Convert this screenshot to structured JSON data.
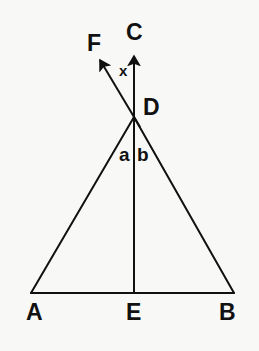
{
  "figure": {
    "kind": "geometry-diagram",
    "background_color": "#f8f8f6",
    "stroke_color": "#111111",
    "stroke_width": 2
  },
  "points": {
    "A": {
      "label": "A",
      "x": 31,
      "y": 293
    },
    "B": {
      "label": "B",
      "x": 234,
      "y": 293
    },
    "D": {
      "label": "D",
      "x": 134,
      "y": 117
    },
    "E": {
      "label": "E",
      "x": 134,
      "y": 293
    },
    "C": {
      "label": "C",
      "x": 134,
      "y": 55
    },
    "F": {
      "label": "F",
      "x": 97,
      "y": 57
    }
  },
  "segments": [
    {
      "name": "side-AD",
      "from": "A",
      "to": "D"
    },
    {
      "name": "side-BD",
      "from": "B",
      "to": "D"
    },
    {
      "name": "base-AB",
      "from": "A",
      "to": "B"
    },
    {
      "name": "median-ED",
      "from": "E",
      "to": "D"
    }
  ],
  "rays": [
    {
      "name": "ray-DC",
      "from": "D",
      "to": "C",
      "arrow": true
    },
    {
      "name": "ray-DF",
      "from": "D",
      "to": "F",
      "arrow": true
    }
  ],
  "labels": {
    "A": {
      "text": "A",
      "x": 26,
      "y": 303,
      "size": "big"
    },
    "B": {
      "text": "B",
      "x": 219,
      "y": 303,
      "size": "big"
    },
    "C": {
      "text": "C",
      "x": 126,
      "y": 20,
      "size": "big"
    },
    "D": {
      "text": "D",
      "x": 143,
      "y": 96,
      "size": "big"
    },
    "E": {
      "text": "E",
      "x": 126,
      "y": 303,
      "size": "big"
    },
    "F": {
      "text": "F",
      "x": 87,
      "y": 31,
      "size": "big"
    },
    "x": {
      "text": "x",
      "x": 119,
      "y": 63,
      "size": "small"
    },
    "a": {
      "text": "a",
      "x": 119,
      "y": 145,
      "size": "mid"
    },
    "b": {
      "text": "b",
      "x": 137,
      "y": 145,
      "size": "mid"
    }
  }
}
